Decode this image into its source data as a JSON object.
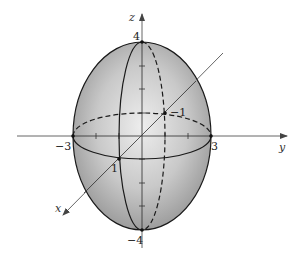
{
  "figure": {
    "type": "ellipsoid-3d-diagram",
    "equation_semiaxes": {
      "x": 1,
      "y": 3,
      "z": 4
    },
    "axes": {
      "x": {
        "label": "x"
      },
      "y": {
        "label": "y"
      },
      "z": {
        "label": "z"
      }
    },
    "point_labels": {
      "z_top": "4",
      "z_bottom": "−4",
      "y_left": "−3",
      "y_right": "3",
      "x_front": "1",
      "x_back": "−1"
    },
    "colors": {
      "surface_light": "#e6e6e6",
      "surface_dark": "#8a8a8a",
      "stroke": "#1a1a1a",
      "axis": "#555555"
    }
  }
}
